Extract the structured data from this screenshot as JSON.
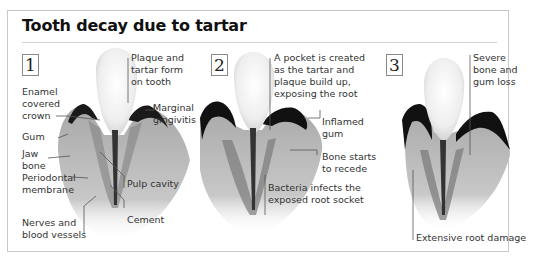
{
  "title": "Tooth decay due to tartar",
  "stages": [
    {
      "number": "1",
      "labels": {
        "plaque": "Plaque and\ntartar form\non tooth",
        "enamel": "Enamel\ncovered\ncrown",
        "marginal": "Marginal\ngingivitis",
        "gum": "Gum",
        "jaw": "Jaw\nbone",
        "periodontal": "Periodontal\nmembrane",
        "pulp": "Pulp cavity",
        "cement": "Cement",
        "nerves": "Nerves and\nblood vessels"
      }
    },
    {
      "number": "2",
      "labels": {
        "pocket": "A pocket is created\nas the tartar and\nplaque build up,\nexposing the root",
        "inflamed": "Inflamed\ngum",
        "bone": "Bone starts\nto recede",
        "bacteria": "Bacteria infects the\nexposed root socket"
      }
    },
    {
      "number": "3",
      "labels": {
        "severe": "Severe\nbone and\ngum loss",
        "root": "Extensive root damage"
      }
    }
  ],
  "colors": {
    "frame": "#c8c8c8",
    "gum_dark": "#1a1a1a",
    "bone": "#b9b9b9",
    "enamel": "#f4f4f4"
  }
}
